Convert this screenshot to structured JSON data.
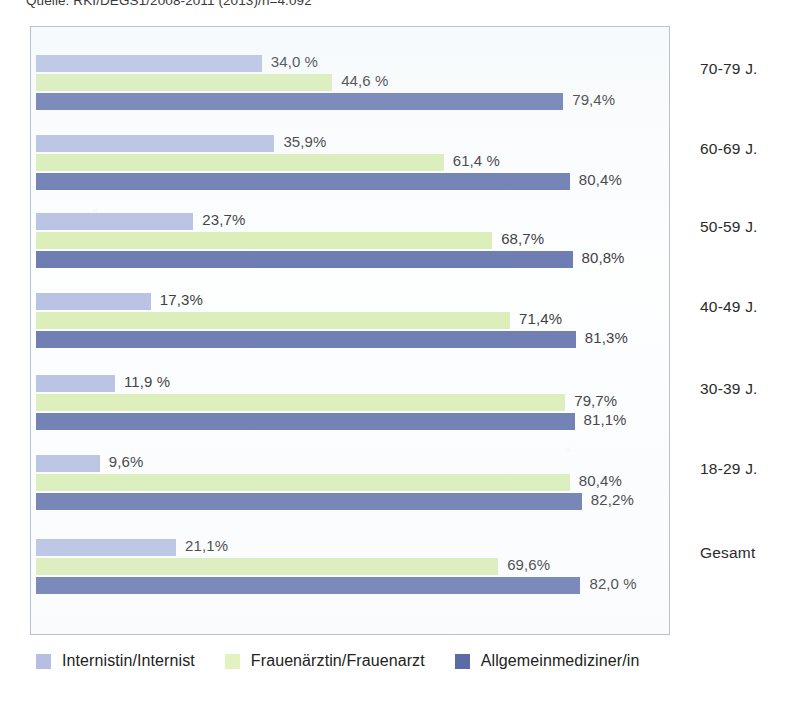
{
  "source_note": "Quelle: RKI/DEGS1/2008-2011 (2013)/n=4.092",
  "legend": {
    "items": [
      {
        "label": "Internistin/Internist",
        "color": "#b6bfe3"
      },
      {
        "label": "Frauenärztin/Frauenarzt",
        "color": "#e2f3c0"
      },
      {
        "label": "Allgemeinmediziner/in",
        "color": "#5b6ba8"
      }
    ]
  },
  "chart_data": {
    "type": "bar",
    "orientation": "horizontal",
    "title": "",
    "subtitle": "",
    "xlabel": "",
    "ylabel": "",
    "xlim": [
      0,
      96
    ],
    "grid": false,
    "legend_position": "bottom",
    "categories": [
      "70-79 J.",
      "60-69 J.",
      "50-59 J.",
      "40-49 J.",
      "30-39 J.",
      "18-29 J.",
      "Gesamt"
    ],
    "series": [
      {
        "name": "Internistin/Internist",
        "color": "#b2bbe0",
        "values": [
          34.0,
          35.9,
          23.7,
          17.3,
          11.9,
          9.6,
          21.1
        ],
        "labels": [
          "34,0 %",
          "35,9%",
          "23,7%",
          "17,3%",
          "11,9 %",
          "9,6%",
          "21,1%"
        ]
      },
      {
        "name": "Frauenärztin/Frauenarzt",
        "color": "#d9eeb0",
        "values": [
          44.6,
          61.4,
          68.7,
          71.4,
          79.7,
          80.4,
          69.6
        ],
        "labels": [
          "44,6 %",
          "61,4 %",
          "68,7%",
          "71,4%",
          "79,7%",
          "80,4%",
          "69,6%"
        ]
      },
      {
        "name": "Allgemeinmediziner/in",
        "color": "#5b6ba8",
        "values": [
          79.4,
          80.4,
          80.8,
          81.3,
          81.1,
          82.2,
          82.0
        ],
        "labels": [
          "79,4%",
          "80,4%",
          "80,8%",
          "81,3%",
          "81,1%",
          "82,2%",
          "82,0 %"
        ]
      }
    ]
  }
}
